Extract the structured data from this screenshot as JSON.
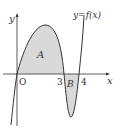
{
  "diagram": {
    "function_label": "y=f(x)",
    "x_axis_label": "x",
    "y_axis_label": "y",
    "origin_label": "O",
    "tick_labels": [
      "3",
      "4"
    ],
    "regions": [
      {
        "label": "A",
        "description": "area between curve and x-axis from 0 to 3 (above axis)"
      },
      {
        "label": "B",
        "description": "area between curve and x-axis from 3 to 4 (below axis)"
      }
    ],
    "colors": {
      "shade": "#d9d9d9",
      "stroke": "#333333"
    }
  }
}
